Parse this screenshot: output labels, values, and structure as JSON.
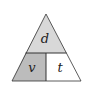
{
  "diagram": {
    "type": "formula-triangle",
    "top": {
      "label": "d",
      "fill": "#d8d8d8"
    },
    "bottom_left": {
      "label": "v",
      "fill": "#bcbcbc"
    },
    "bottom_right": {
      "label": "t",
      "fill": "#ffffff"
    },
    "stroke": "#333333"
  }
}
